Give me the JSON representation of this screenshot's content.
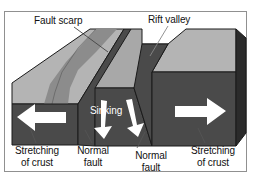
{
  "figure": {
    "frame_color": "#909090",
    "background": "#ffffff"
  },
  "palette": {
    "top_surface": "#b4b4b4",
    "fault_scarp_band": "#8c8c8c",
    "valley_floor": "#a8a8a8",
    "front_face": "#4a4a4a",
    "side_face": "#2b2b2b",
    "inner_wall": "#555555",
    "arrow_fill": "#ffffff",
    "outline": "#1a1a1a",
    "leader_line": "#666666",
    "text": "#111111"
  },
  "labels": {
    "fault_scarp": "Fault scarp",
    "rift_valley": "Rift valley",
    "sinking": "Sinking",
    "stretching_left_line1": "Stretching",
    "stretching_left_line2": "of crust",
    "normal_fault_left_line1": "Normal",
    "normal_fault_left_line2": "fault",
    "normal_fault_right_line1": "Normal",
    "normal_fault_right_line2": "fault",
    "stretching_right_line1": "Stretching",
    "stretching_right_line2": "of crust"
  },
  "arrows": {
    "left": {
      "name": "stretching-left-arrow",
      "direction": "left",
      "color": "#ffffff"
    },
    "right": {
      "name": "stretching-right-arrow",
      "direction": "right",
      "color": "#ffffff"
    },
    "sinking_a": {
      "name": "sinking-arrow-left",
      "direction": "down",
      "color": "#ffffff"
    },
    "sinking_b": {
      "name": "sinking-arrow-right",
      "direction": "down",
      "color": "#ffffff"
    }
  }
}
